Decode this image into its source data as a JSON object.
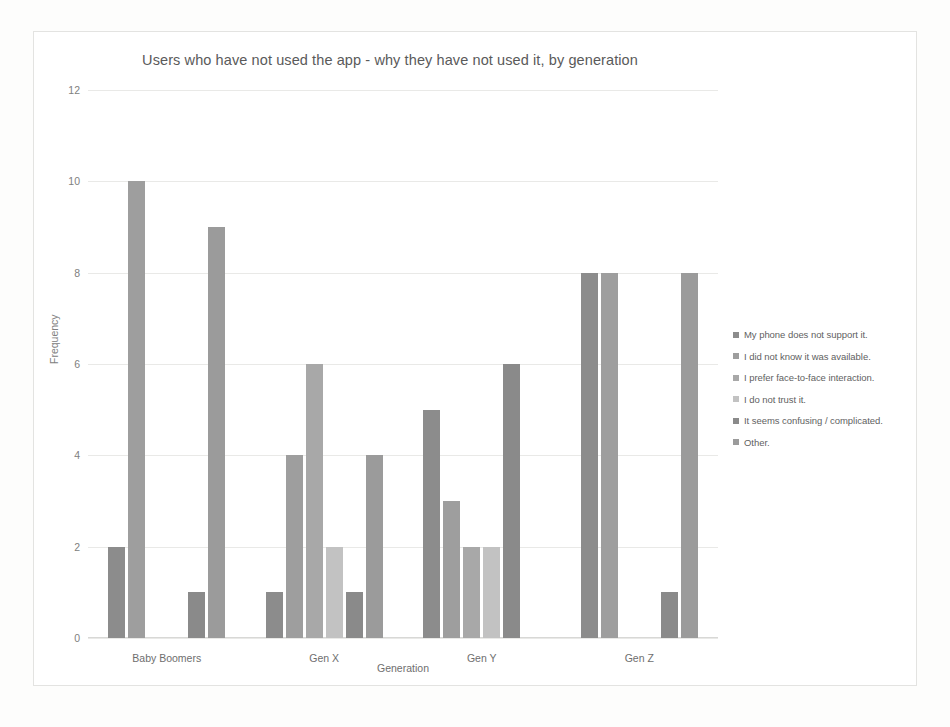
{
  "chart_data": {
    "type": "bar",
    "title": "Users who have not used the app - why they have not used it, by generation",
    "xlabel": "Generation",
    "ylabel": "Frequency",
    "ylim": [
      0,
      12
    ],
    "ytick_step": 2,
    "yticks": [
      "12",
      "10",
      "8",
      "6",
      "4",
      "2",
      "0"
    ],
    "grid": true,
    "legend_position": "right",
    "categories": [
      "Baby Boomers",
      "Gen X",
      "Gen Y",
      "Gen Z"
    ],
    "series": [
      {
        "name": "My phone does not support it.",
        "color": "#8c8c8c",
        "values": [
          2,
          1,
          5,
          8
        ]
      },
      {
        "name": "I did not know it was available.",
        "color": "#9e9e9e",
        "values": [
          10,
          4,
          3,
          8
        ]
      },
      {
        "name": "I prefer face-to-face interaction.",
        "color": "#a8a8a8",
        "values": [
          null,
          6,
          2,
          null
        ]
      },
      {
        "name": "I do not trust it.",
        "color": "#c2c2c2",
        "values": [
          null,
          2,
          2,
          null
        ]
      },
      {
        "name": "It seems confusing / complicated.",
        "color": "#8a8a8a",
        "values": [
          1,
          1,
          6,
          1
        ]
      },
      {
        "name": "Other.",
        "color": "#9b9b9b",
        "values": [
          9,
          4,
          null,
          8
        ]
      }
    ]
  }
}
